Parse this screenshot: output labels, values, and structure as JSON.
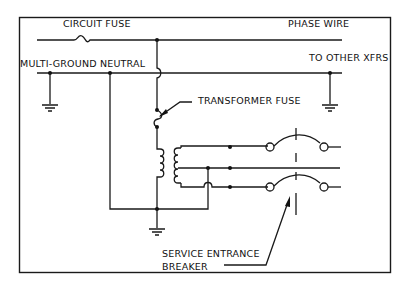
{
  "diagram": {
    "labels": {
      "circuit_fuse": "CIRCUIT FUSE",
      "phase_wire": "PHASE WIRE",
      "multi_ground_neutral": "MULTI-GROUND NEUTRAL",
      "to_other_xfrs": "TO OTHER XFRS",
      "transformer_fuse": "TRANSFORMER FUSE",
      "service_entrance": "SERVICE ENTRANCE",
      "breaker": "BREAKER"
    },
    "colors": {
      "line": "#1a1a1a",
      "background": "#ffffff"
    }
  }
}
